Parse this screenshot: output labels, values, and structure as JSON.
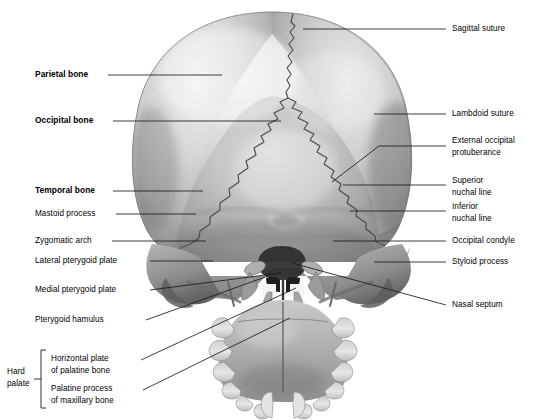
{
  "figure": {
    "view": "posterior-inferior skull",
    "background_color": "#ffffff",
    "line_color": "#1a1a1a",
    "text_color": "#000000",
    "bone_light": "#e9e9e9",
    "bone_mid": "#b9b9b9",
    "bone_dark": "#8a8a8a",
    "bone_shadow": "#5e5e5e"
  },
  "labels_left": [
    {
      "id": "parietal-bone",
      "text": "Parietal bone",
      "bold": true,
      "x": 35,
      "y": 70
    },
    {
      "id": "occipital-bone",
      "text": "Occipital bone",
      "bold": true,
      "x": 35,
      "y": 116
    },
    {
      "id": "temporal-bone",
      "text": "Temporal bone",
      "bold": true,
      "x": 35,
      "y": 186
    },
    {
      "id": "mastoid-process",
      "text": "Mastoid process",
      "bold": false,
      "x": 35,
      "y": 212
    },
    {
      "id": "zygomatic-arch",
      "text": "Zygomatic arch",
      "bold": false,
      "x": 35,
      "y": 238
    },
    {
      "id": "lateral-pterygoid-plate",
      "text": "Lateral pterygoid plate",
      "bold": false,
      "x": 35,
      "y": 258
    },
    {
      "id": "medial-pterygoid-plate",
      "text": "Medial pterygoid plate",
      "bold": false,
      "x": 35,
      "y": 287
    },
    {
      "id": "pterygoid-hamulus",
      "text": "Pterygoid hamulus",
      "bold": false,
      "x": 35,
      "y": 317
    }
  ],
  "labels_right": [
    {
      "id": "sagittal-suture",
      "text": "Sagittal suture",
      "x": 452,
      "y": 24,
      "lines": [
        "Sagittal suture"
      ]
    },
    {
      "id": "lambdoid-suture",
      "text": "Lambdoid suture",
      "x": 452,
      "y": 110,
      "lines": [
        "Lambdoid suture"
      ]
    },
    {
      "id": "external-occipital-protuberance",
      "text": "External occipital protuberance",
      "x": 452,
      "y": 137,
      "lines": [
        "External occipital",
        "protuberance"
      ]
    },
    {
      "id": "superior-nuchal-line",
      "text": "Superior nuchal line",
      "x": 452,
      "y": 177,
      "lines": [
        "Superior",
        "nuchal line"
      ]
    },
    {
      "id": "inferior-nuchal-line",
      "text": "Inferior nuchal line",
      "x": 452,
      "y": 203,
      "lines": [
        "Inferior",
        "nuchal line"
      ]
    },
    {
      "id": "occipital-condyle",
      "text": "Occipital condyle",
      "x": 452,
      "y": 237,
      "lines": [
        "Occipital condyle"
      ]
    },
    {
      "id": "styloid-process",
      "text": "Styloid process",
      "x": 452,
      "y": 258,
      "lines": [
        "Styloid process"
      ]
    },
    {
      "id": "nasal-septum",
      "text": "Nasal septum",
      "x": 452,
      "y": 301,
      "lines": [
        "Nasal septum"
      ]
    }
  ],
  "hard_palate": {
    "bracket_label": "Hard\npalate",
    "bracket_label_line1": "Hard",
    "bracket_label_line2": "palate",
    "bracket_x": 7,
    "bracket_y": 364,
    "items": [
      {
        "id": "horizontal-plate-of-palatine-bone",
        "line1": "Horizontal plate",
        "line2": "of palatine bone",
        "x": 51,
        "y": 357
      },
      {
        "id": "palatine-process-of-maxillary-bone",
        "line1": "Palatine process",
        "line2": "of maxillary bone",
        "x": 51,
        "y": 387
      }
    ]
  },
  "leaders": {
    "parietal_bone": "M108,75 L222,75",
    "occipital_bone": "M113,121 L281,121",
    "temporal_bone": "M113,191 L203,191",
    "mastoid_process": "M116,214 L196,214",
    "zygomatic_arch": "M112,241 L206,241",
    "lateral_pterygoid_plate": "M150,261 L213,261",
    "medial_pterygoid_plate": "M150,290 L281,273",
    "pterygoid_hamulus": "M146,320 L268,276",
    "horizontal_plate": "M141,360 L296,288",
    "palatine_process": "M143,390 L290,318",
    "sagittal_suture": "M303,29 L446,29",
    "lambdoid_suture": "M374,114 L446,114",
    "ext_occ_protuberance": "M332,182 L379,146 L446,146",
    "superior_nuchal_line": "M343,185 L446,185",
    "inferior_nuchal_line": "M350,211 L446,211",
    "occipital_condyle": "M333,241 L446,241",
    "styloid_process": "M374,262 L446,262",
    "nasal_septum": "M292,263 L446,305"
  }
}
